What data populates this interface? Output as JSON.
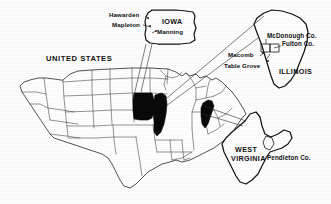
{
  "figure": {
    "type": "reference-locality-map",
    "country_label": "UNITED STATES",
    "highlighted_states": [
      "Iowa",
      "Illinois",
      "West Virginia"
    ]
  },
  "main_map": {
    "name": "united-states-outline-map",
    "country_label": "UNITED STATES"
  },
  "insets": [
    {
      "id": "iowa",
      "state_label": "IOWA",
      "localities": [
        {
          "name": "Hawarden"
        },
        {
          "name": "Mapleton"
        },
        {
          "name": "Manning"
        }
      ]
    },
    {
      "id": "illinois",
      "state_label": "ILLINOIS",
      "counties": [
        {
          "name": "McDonough Co."
        },
        {
          "name": "Fulton Co."
        }
      ],
      "localities": [
        {
          "name": "Macomb"
        },
        {
          "name": "Table Grove"
        }
      ]
    },
    {
      "id": "west-virginia",
      "state_label": "WEST VIRGINIA",
      "state_label_line1": "WEST",
      "state_label_line2": "VIRGINIA",
      "counties": [
        {
          "name": "Pendleton Co."
        }
      ]
    }
  ],
  "colors": {
    "highlight": "#090909",
    "outline": "#1a1a1a",
    "background": "#ffffff",
    "state_lines": "#3a3a3a"
  }
}
